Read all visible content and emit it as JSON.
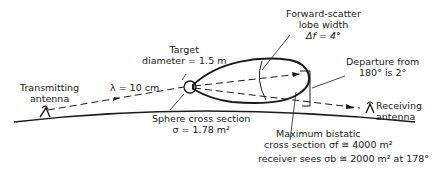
{
  "diagram": {
    "labels": {
      "transmitting_line1": "Transmitting",
      "transmitting_line2": "antenna",
      "wavelength": "λ = 10 cm",
      "target_line1": "Target",
      "target_line2": "diameter = 1.5 m",
      "lobe_line1": "Forward-scatter",
      "lobe_line2": "lobe width",
      "lobe_line3": "Δf = 4°",
      "departure_line1": "Departure from",
      "departure_line2": "180° is 2°",
      "receiving_line1": "Receiving",
      "receiving_line2": "antenna",
      "sphere_line1": "Sphere cross section",
      "sphere_line2": "σ = 1.78 m²",
      "bistatic_line1": "Maximum bistatic",
      "bistatic_line2": "cross section σf ≅ 4000 m²",
      "bistatic_line3": "receiver sees σb ≅ 2000 m² at 178°"
    },
    "colors": {
      "ink": "#1a1a1a",
      "background": "#ffffff"
    }
  }
}
